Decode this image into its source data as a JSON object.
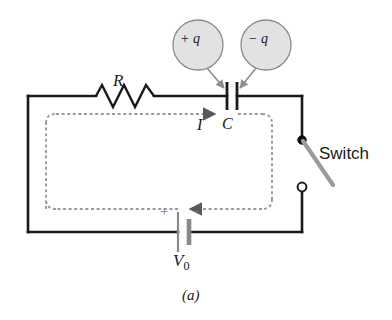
{
  "figure": {
    "caption": "(a)",
    "type": "rc-circuit-schematic"
  },
  "components": {
    "resistor": {
      "label": "R",
      "name": "resistor"
    },
    "capacitor": {
      "label": "C",
      "name": "capacitor"
    },
    "battery": {
      "label": "V",
      "subscript": "0",
      "plus_sign": "+",
      "minus_sign": "−"
    },
    "switch": {
      "label": "Switch",
      "state": "open"
    },
    "current": {
      "label": "I",
      "direction": "clockwise"
    }
  },
  "callouts": [
    {
      "id": "positive-charge",
      "label": "+ q"
    },
    {
      "id": "negative-charge",
      "label": "− q"
    }
  ],
  "colors": {
    "wire": "#1a1a1a",
    "current_loop": "#9a9a9a",
    "callout_fill": "#e2e2e2",
    "callout_stroke": "#8c8c8c",
    "switch_lever": "#999999",
    "battery_plate": "#8a8a8a",
    "background": "#ffffff"
  }
}
